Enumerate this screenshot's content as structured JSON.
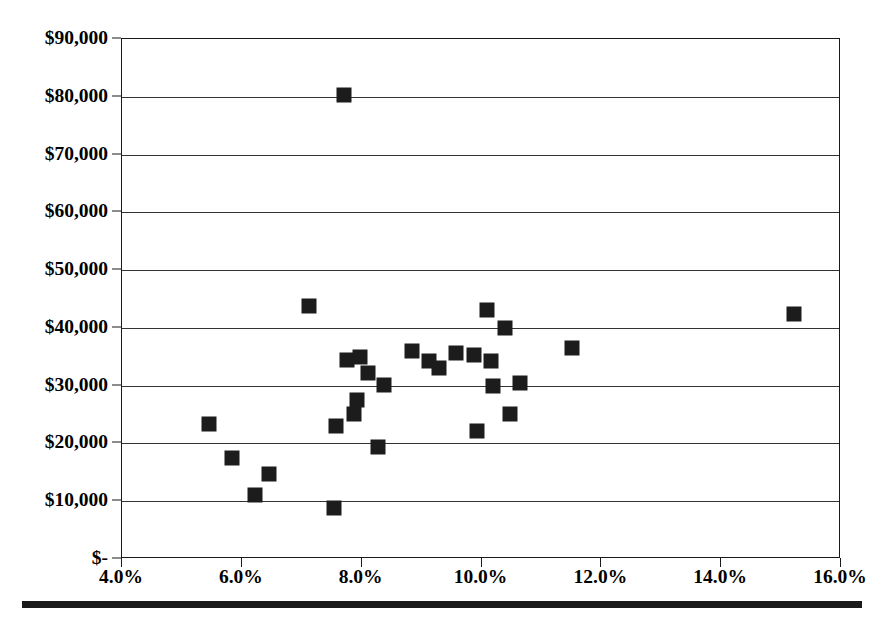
{
  "chart_data": {
    "type": "scatter",
    "title": "",
    "subtitle": "",
    "xlabel": "",
    "ylabel": "",
    "xlim": [
      4.0,
      16.0
    ],
    "ylim": [
      0,
      90000
    ],
    "grid": true,
    "grid_axis": "y",
    "legend": false,
    "legend_position": "none",
    "marker_style": "filled-square",
    "marker_color": "#1c1c1c",
    "x_tick_labels": [
      "4.0%",
      "6.0%",
      "8.0%",
      "10.0%",
      "12.0%",
      "14.0%",
      "16.0%"
    ],
    "x_tick_values": [
      4.0,
      6.0,
      8.0,
      10.0,
      12.0,
      14.0,
      16.0
    ],
    "y_tick_labels": [
      "$-",
      "$10,000",
      "$20,000",
      "$30,000",
      "$40,000",
      "$50,000",
      "$60,000",
      "$70,000",
      "$80,000",
      "$90,000"
    ],
    "y_tick_values": [
      0,
      10000,
      20000,
      30000,
      40000,
      50000,
      60000,
      70000,
      80000,
      90000
    ],
    "series": [
      {
        "name": "Observations",
        "points": [
          [
            5.45,
            23400
          ],
          [
            5.83,
            17400
          ],
          [
            6.22,
            11100
          ],
          [
            6.45,
            14700
          ],
          [
            7.12,
            43800
          ],
          [
            7.54,
            8800
          ],
          [
            7.57,
            23000
          ],
          [
            7.71,
            80300
          ],
          [
            7.75,
            34500
          ],
          [
            7.88,
            25100
          ],
          [
            7.93,
            27600
          ],
          [
            7.98,
            35000
          ],
          [
            8.1,
            32200
          ],
          [
            8.28,
            19300
          ],
          [
            8.37,
            30200
          ],
          [
            8.84,
            36000
          ],
          [
            9.12,
            34300
          ],
          [
            9.29,
            33000
          ],
          [
            9.57,
            35700
          ],
          [
            9.87,
            35300
          ],
          [
            9.92,
            22100
          ],
          [
            10.09,
            43100
          ],
          [
            10.16,
            34200
          ],
          [
            10.2,
            30000
          ],
          [
            10.39,
            39900
          ],
          [
            10.48,
            25100
          ],
          [
            10.65,
            30400
          ],
          [
            11.51,
            36500
          ],
          [
            15.21,
            42400
          ]
        ]
      }
    ]
  },
  "axes": {
    "plot_left_px": 121,
    "plot_top_px": 38,
    "plot_width_px": 719,
    "plot_height_px": 520
  }
}
